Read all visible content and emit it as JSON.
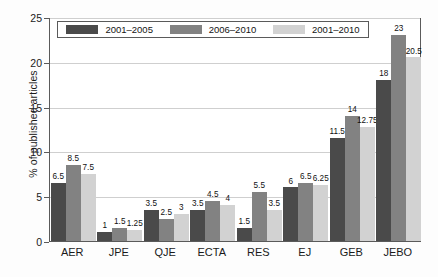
{
  "chart_data": {
    "type": "bar",
    "title": "",
    "xlabel": "",
    "ylabel": "% of published articles",
    "ylim": [
      0,
      25
    ],
    "yticks": [
      0,
      5,
      10,
      15,
      20,
      25
    ],
    "grid": true,
    "legend_position": "top-inside",
    "categories": [
      "AER",
      "JPE",
      "QJE",
      "ECTA",
      "RES",
      "EJ",
      "GEB",
      "JEBO"
    ],
    "series": [
      {
        "name": "2001–2005",
        "color": "#4a4a4a",
        "values": [
          6.5,
          1,
          3.5,
          3.5,
          1.5,
          6,
          11.5,
          18
        ],
        "labels": [
          "6.5",
          "1",
          "3.5",
          "3.5",
          "1.5",
          "6",
          "11.5",
          "18"
        ]
      },
      {
        "name": "2006–2010",
        "color": "#828282",
        "values": [
          8.5,
          1.5,
          2.5,
          4.5,
          5.5,
          6.5,
          14,
          23
        ],
        "labels": [
          "8.5",
          "1.5",
          "2.5",
          "4.5",
          "5.5",
          "6.5",
          "14",
          "23"
        ]
      },
      {
        "name": "2001–2010",
        "color": "#d2d2d2",
        "values": [
          7.5,
          1.25,
          3,
          4,
          3.5,
          6.25,
          12.75,
          20.5
        ],
        "labels": [
          "7.5",
          "1.25",
          "3",
          "4",
          "3.5",
          "6.25",
          "12.75",
          "20.5"
        ]
      }
    ]
  },
  "axis": {
    "ytick_labels": [
      "0",
      "5",
      "10",
      "15",
      "20",
      "25"
    ],
    "ylabel_text": "% of published articles"
  },
  "legend": {
    "entries": [
      {
        "label": "2001–2005",
        "color": "#4a4a4a"
      },
      {
        "label": "2006–2010",
        "color": "#828282"
      },
      {
        "label": "2001–2010",
        "color": "#d2d2d2"
      }
    ]
  }
}
